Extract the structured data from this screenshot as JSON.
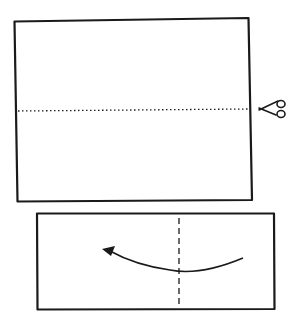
{
  "diagram": {
    "type": "origami-instructions",
    "steps": [
      {
        "name": "step-1",
        "description": "Square-ish sheet with horizontal dotted cut line",
        "action": "cut",
        "icon": "scissors-icon"
      },
      {
        "name": "step-2",
        "description": "Half sheet with vertical dashed fold line and curved arrow pointing left",
        "action": "fold",
        "icon": "curved-arrow-icon"
      }
    ],
    "colors": {
      "stroke": "#1a1a1a",
      "background": "#ffffff"
    }
  }
}
